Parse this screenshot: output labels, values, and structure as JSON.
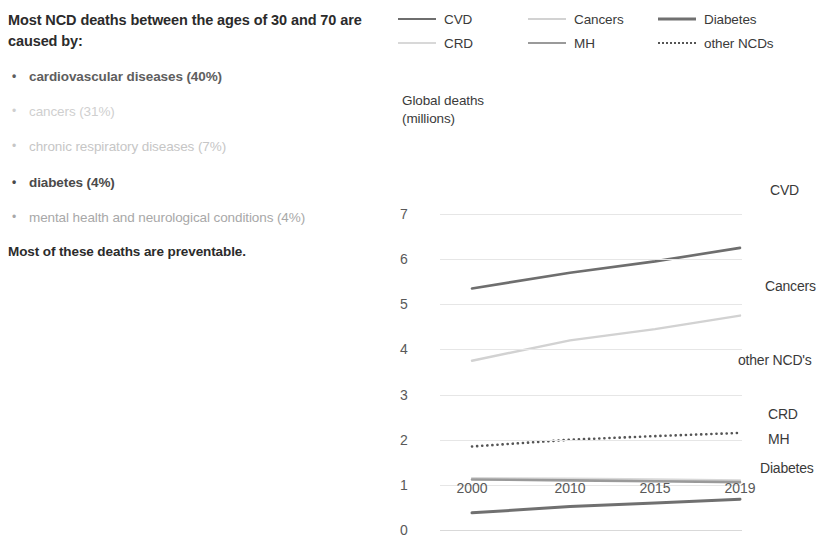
{
  "left_panel": {
    "headline": "Most NCD deaths between the ages of 30 and 70 are caused by:",
    "bullets": [
      {
        "text": "cardiovascular diseases (40%)",
        "color": "#5e5e5e",
        "weight": "bold"
      },
      {
        "text": "cancers (31%)",
        "color": "#cfcfcf",
        "weight": "normal"
      },
      {
        "text": "chronic respiratory diseases (7%)",
        "color": "#c6c6c6",
        "weight": "normal"
      },
      {
        "text": "diabetes (4%)",
        "color": "#4a4a4a",
        "weight": "bold"
      },
      {
        "text": "mental health and neurological conditions (4%)",
        "color": "#a8a8a8",
        "weight": "normal"
      }
    ],
    "closing": "Most of these deaths are preventable."
  },
  "legend": {
    "items": [
      {
        "label": "CVD",
        "color": "#6e6e6e",
        "style": "solid",
        "width": 2.6
      },
      {
        "label": "Cancers",
        "color": "#d2d2d2",
        "style": "solid",
        "width": 2.4
      },
      {
        "label": "Diabetes",
        "color": "#707070",
        "style": "solid",
        "width": 3.0
      },
      {
        "label": "CRD",
        "color": "#d8d8d8",
        "style": "solid",
        "width": 2.2
      },
      {
        "label": "MH",
        "color": "#9a9a9a",
        "style": "solid",
        "width": 2.6
      },
      {
        "label": "other NCDs",
        "color": "#555555",
        "style": "dotted",
        "width": 2.6
      }
    ]
  },
  "chart_data": {
    "type": "line",
    "title": "Global deaths (millions)",
    "title_line1": "Global deaths",
    "title_line2": "(millions)",
    "xlabel": "",
    "ylabel": "Global deaths (millions)",
    "x": [
      2000,
      2010,
      2015,
      2019
    ],
    "categories": [
      "2000",
      "2010",
      "2015",
      "2019"
    ],
    "ylim": [
      0,
      7
    ],
    "yticks": [
      7,
      6,
      5,
      4,
      3,
      2,
      1,
      0
    ],
    "grid": true,
    "legend_position": "top",
    "series": [
      {
        "name": "CVD",
        "label": "CVD",
        "color": "#6e6e6e",
        "style": "solid",
        "width": 2.6,
        "values": [
          5.35,
          5.7,
          5.95,
          6.25
        ]
      },
      {
        "name": "Cancers",
        "label": "Cancers",
        "color": "#d2d2d2",
        "style": "solid",
        "width": 2.4,
        "values": [
          3.75,
          4.2,
          4.45,
          4.75
        ]
      },
      {
        "name": "other NCDs",
        "label": "other NCD's",
        "color": "#555555",
        "style": "dotted",
        "width": 2.6,
        "values": [
          1.85,
          2.0,
          2.08,
          2.15
        ]
      },
      {
        "name": "CRD",
        "label": "CRD",
        "color": "#d8d8d8",
        "style": "solid",
        "width": 2.2,
        "values": [
          1.15,
          1.14,
          1.12,
          1.1
        ]
      },
      {
        "name": "MH",
        "label": "MH",
        "color": "#9a9a9a",
        "style": "solid",
        "width": 2.6,
        "values": [
          1.12,
          1.1,
          1.08,
          1.06
        ]
      },
      {
        "name": "Diabetes",
        "label": "Diabetes",
        "color": "#707070",
        "style": "solid",
        "width": 3.0,
        "values": [
          0.38,
          0.52,
          0.6,
          0.68
        ]
      }
    ],
    "series_labels": [
      {
        "text": "CVD",
        "x": 770,
        "y": 182
      },
      {
        "text": "Cancers",
        "x": 765,
        "y": 278
      },
      {
        "text": "other NCD's",
        "x": 738,
        "y": 352
      },
      {
        "text": "CRD",
        "x": 768,
        "y": 406
      },
      {
        "text": "MH",
        "x": 768,
        "y": 431
      },
      {
        "text": "Diabetes",
        "x": 760,
        "y": 460
      }
    ]
  }
}
